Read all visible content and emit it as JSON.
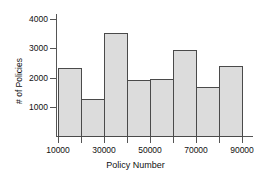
{
  "chart_data": {
    "type": "bar",
    "title": "",
    "subtitle": "",
    "xlabel": "Policy Number",
    "ylabel": "# of Policies",
    "xlim": [
      10000,
      90000
    ],
    "ylim": [
      0,
      4200
    ],
    "grid": false,
    "legend": null,
    "bin_width": 10000,
    "bin_edges": [
      10000,
      20000,
      30000,
      40000,
      50000,
      60000,
      70000,
      80000,
      90000
    ],
    "categories": [
      "10000-20000",
      "20000-30000",
      "30000-40000",
      "40000-50000",
      "50000-60000",
      "60000-70000",
      "70000-80000",
      "80000-90000"
    ],
    "values": [
      2250,
      1230,
      3380,
      1870,
      1880,
      2820,
      1630,
      2320
    ],
    "x_tick_labels": [
      "10000",
      "30000",
      "50000",
      "70000",
      "90000"
    ],
    "x_tick_values": [
      10000,
      30000,
      50000,
      70000,
      90000
    ],
    "y_tick_labels": [
      "1000",
      "2000",
      "3000",
      "4000"
    ],
    "y_tick_values": [
      1000,
      2000,
      3000,
      4000
    ],
    "bar_fill_color": "#dcdcdc",
    "bar_edge_color": "#4a4a4a",
    "axis_color": "#555555",
    "text_color": "#111111",
    "background_color": "#ffffff"
  }
}
